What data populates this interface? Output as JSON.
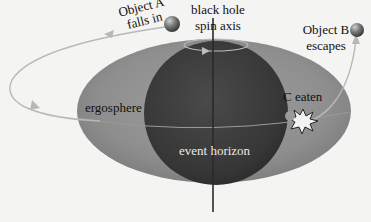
{
  "diagram": {
    "labels": {
      "object_a_line1": "Object A",
      "object_a_line2": "falls in",
      "axis_line1": "black hole",
      "axis_line2": "spin axis",
      "object_b_line1": "Object B",
      "object_b_line2": "escapes",
      "c_eaten": "C eaten",
      "ergosphere": "ergosphere",
      "event_horizon": "event horizon"
    },
    "colors": {
      "background": "#f4f4f2",
      "ergosphere": "#8d8d8d",
      "event_horizon": "#3a3a3a",
      "orbit_path": "#b5b5b5",
      "axis": "#2a2a2a",
      "object_sphere": "#6e6e6e",
      "explosion_fill": "#f0f0f0"
    },
    "elements": [
      {
        "name": "ergosphere",
        "shape": "ellipse"
      },
      {
        "name": "event-horizon",
        "shape": "sphere"
      },
      {
        "name": "spin-axis",
        "shape": "line"
      },
      {
        "name": "object-a",
        "shape": "sphere"
      },
      {
        "name": "object-b",
        "shape": "sphere"
      },
      {
        "name": "c-eaten-burst",
        "shape": "starburst"
      },
      {
        "name": "orbit-path",
        "shape": "curve-with-arrows"
      }
    ]
  }
}
